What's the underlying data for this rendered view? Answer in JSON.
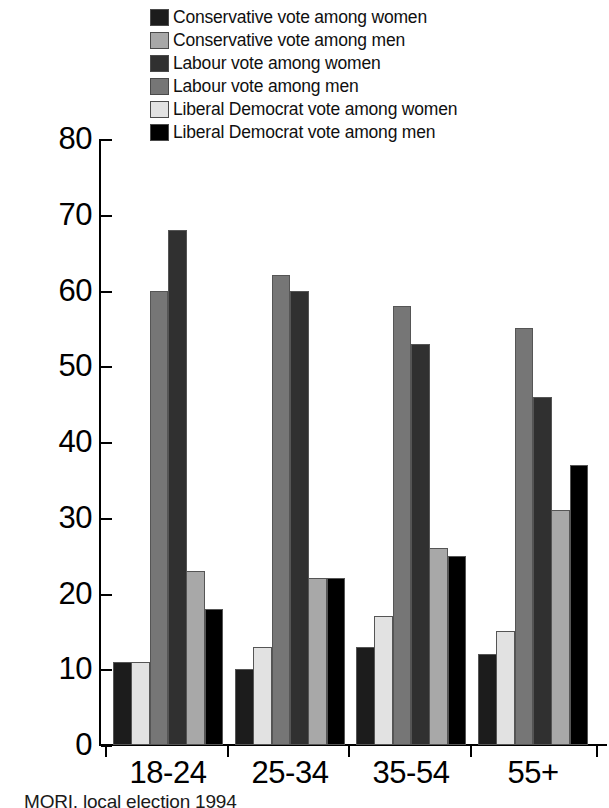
{
  "chart_data": {
    "type": "bar",
    "title": "",
    "xlabel": "",
    "ylabel": "",
    "ylim": [
      0,
      80
    ],
    "yticks": [
      0,
      10,
      20,
      30,
      40,
      50,
      60,
      70,
      80
    ],
    "grid": false,
    "legend_position": "top",
    "categories": [
      "18-24",
      "25-34",
      "35-54",
      "55+"
    ],
    "series": [
      {
        "name": "Conservative vote among women",
        "color": "#1c1c1c",
        "values": [
          11,
          10,
          13,
          12
        ]
      },
      {
        "name": "Liberal Democrat vote among women",
        "color": "#e2e2e2",
        "values": [
          11,
          13,
          17,
          15
        ]
      },
      {
        "name": "Labour vote among men",
        "color": "#767676",
        "values": [
          60,
          62,
          58,
          55
        ]
      },
      {
        "name": "Labour vote among women",
        "color": "#303030",
        "values": [
          68,
          60,
          53,
          46
        ]
      },
      {
        "name": "Conservative vote among men",
        "color": "#a8a8a8",
        "values": [
          23,
          22,
          26,
          31
        ]
      },
      {
        "name": "Liberal Democrat vote among men",
        "color": "#000000",
        "values": [
          18,
          22,
          25,
          37
        ]
      }
    ],
    "legend_order": [
      {
        "name": "Conservative vote among women",
        "color": "#1c1c1c"
      },
      {
        "name": "Conservative vote among men",
        "color": "#a8a8a8"
      },
      {
        "name": "Labour vote among women",
        "color": "#303030"
      },
      {
        "name": "Labour vote among men",
        "color": "#767676"
      },
      {
        "name": "Liberal Democrat vote among women",
        "color": "#e2e2e2"
      },
      {
        "name": "Liberal Democrat vote among men",
        "color": "#000000"
      }
    ]
  },
  "caption": "MORI, local election 1994"
}
